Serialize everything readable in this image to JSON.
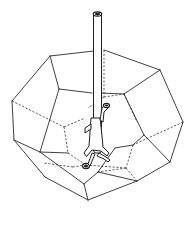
{
  "figure": {
    "colors": {
      "background": "#ffffff",
      "line": "#2a2a2a",
      "hidden_line": "#3a3a3a"
    },
    "line_styles": {
      "visible_edges": "solid",
      "hidden_edges": "dashed"
    }
  }
}
